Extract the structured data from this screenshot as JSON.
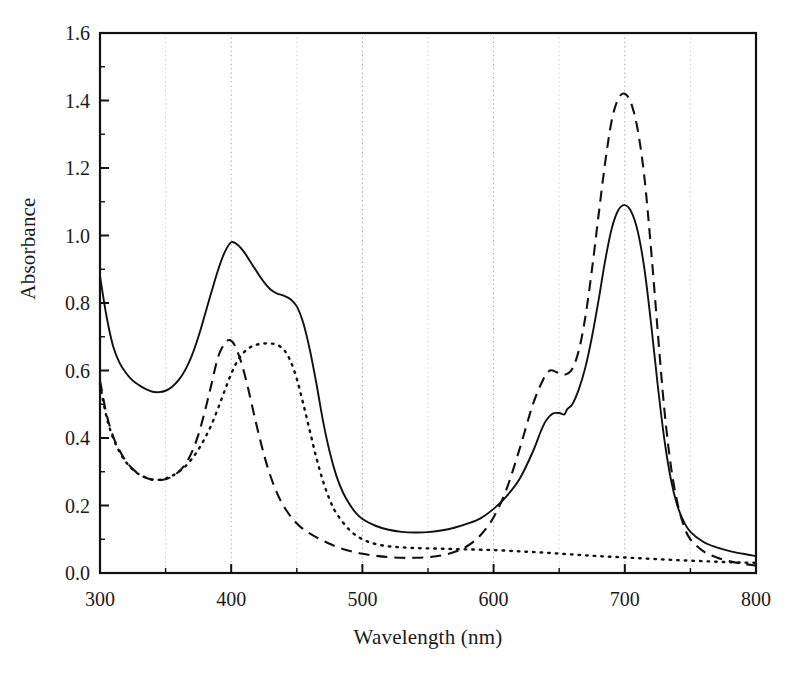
{
  "chart_data": {
    "type": "line",
    "title": "",
    "xlabel": "Wavelength (nm)",
    "ylabel": "Absorbance",
    "xlim": [
      300,
      800
    ],
    "ylim": [
      0.0,
      1.6
    ],
    "xticks": [
      300,
      400,
      500,
      600,
      700,
      800
    ],
    "xtick_labels": [
      "300",
      "400",
      "500",
      "600",
      "700",
      "800"
    ],
    "xminor_step": 50,
    "yticks": [
      0.0,
      0.2,
      0.4,
      0.6,
      0.8,
      1.0,
      1.2,
      1.4,
      1.6
    ],
    "ytick_labels": [
      "0.0",
      "0.2",
      "0.4",
      "0.6",
      "0.8",
      "1.0",
      "1.2",
      "1.4",
      "1.6"
    ],
    "yminor_step": 0.1,
    "grid": "vertical-dotted-every-50nm",
    "legend": "none",
    "frame": "full-box",
    "series": [
      {
        "name": "solid",
        "style": "solid",
        "color": "#111111",
        "peaks_nm": [
          400,
          430,
          645,
          700
        ],
        "peak_values": [
          0.98,
          0.83,
          0.475,
          1.09
        ],
        "x": [
          300,
          305,
          310,
          315,
          320,
          325,
          330,
          335,
          340,
          345,
          350,
          355,
          360,
          365,
          370,
          375,
          380,
          385,
          390,
          395,
          400,
          405,
          410,
          415,
          420,
          425,
          430,
          435,
          440,
          445,
          450,
          455,
          460,
          465,
          470,
          475,
          480,
          485,
          490,
          495,
          500,
          510,
          520,
          530,
          540,
          550,
          560,
          570,
          580,
          590,
          600,
          610,
          620,
          630,
          636,
          640,
          645,
          650,
          654,
          656,
          660,
          665,
          670,
          675,
          680,
          685,
          690,
          695,
          700,
          705,
          710,
          715,
          720,
          725,
          730,
          735,
          740,
          745,
          750,
          760,
          770,
          780,
          790,
          800
        ],
        "y": [
          0.88,
          0.76,
          0.672,
          0.622,
          0.592,
          0.57,
          0.556,
          0.545,
          0.537,
          0.536,
          0.54,
          0.552,
          0.572,
          0.602,
          0.644,
          0.7,
          0.766,
          0.833,
          0.898,
          0.95,
          0.98,
          0.972,
          0.95,
          0.92,
          0.89,
          0.862,
          0.84,
          0.828,
          0.822,
          0.812,
          0.79,
          0.74,
          0.66,
          0.56,
          0.45,
          0.36,
          0.29,
          0.24,
          0.205,
          0.178,
          0.16,
          0.14,
          0.128,
          0.122,
          0.12,
          0.121,
          0.126,
          0.134,
          0.146,
          0.162,
          0.19,
          0.228,
          0.28,
          0.36,
          0.42,
          0.452,
          0.472,
          0.474,
          0.47,
          0.485,
          0.5,
          0.545,
          0.61,
          0.7,
          0.808,
          0.925,
          1.02,
          1.075,
          1.09,
          1.07,
          1.01,
          0.9,
          0.74,
          0.56,
          0.4,
          0.28,
          0.2,
          0.152,
          0.122,
          0.092,
          0.076,
          0.065,
          0.057,
          0.05
        ]
      },
      {
        "name": "dashed",
        "style": "dashed",
        "color": "#111111",
        "peaks_nm": [
          399,
          643,
          700
        ],
        "peak_values": [
          0.69,
          0.6,
          1.42
        ],
        "x": [
          300,
          305,
          310,
          315,
          320,
          325,
          330,
          335,
          340,
          345,
          350,
          355,
          360,
          365,
          370,
          375,
          380,
          385,
          390,
          395,
          399,
          403,
          408,
          413,
          418,
          423,
          428,
          433,
          438,
          443,
          448,
          453,
          458,
          463,
          470,
          480,
          490,
          500,
          510,
          520,
          530,
          540,
          550,
          560,
          570,
          580,
          590,
          600,
          610,
          620,
          630,
          638,
          643,
          648,
          652,
          656,
          660,
          665,
          670,
          675,
          680,
          685,
          690,
          695,
          700,
          705,
          710,
          715,
          720,
          725,
          730,
          735,
          740,
          745,
          750,
          760,
          770,
          780,
          790,
          800
        ],
        "y": [
          0.57,
          0.47,
          0.405,
          0.362,
          0.33,
          0.308,
          0.292,
          0.282,
          0.276,
          0.275,
          0.278,
          0.286,
          0.3,
          0.322,
          0.358,
          0.41,
          0.48,
          0.56,
          0.64,
          0.68,
          0.69,
          0.672,
          0.62,
          0.545,
          0.46,
          0.38,
          0.31,
          0.255,
          0.212,
          0.18,
          0.155,
          0.136,
          0.122,
          0.11,
          0.096,
          0.078,
          0.066,
          0.057,
          0.051,
          0.047,
          0.045,
          0.045,
          0.047,
          0.052,
          0.062,
          0.08,
          0.112,
          0.165,
          0.25,
          0.37,
          0.5,
          0.575,
          0.6,
          0.595,
          0.588,
          0.59,
          0.605,
          0.66,
          0.76,
          0.9,
          1.06,
          1.215,
          1.34,
          1.405,
          1.42,
          1.39,
          1.31,
          1.17,
          0.96,
          0.72,
          0.49,
          0.32,
          0.21,
          0.14,
          0.1,
          0.064,
          0.046,
          0.035,
          0.027,
          0.022
        ]
      },
      {
        "name": "dotted",
        "style": "dotted",
        "color": "#111111",
        "peaks_nm": [
          430
        ],
        "peak_values": [
          0.68
        ],
        "x": [
          300,
          305,
          310,
          315,
          320,
          325,
          330,
          335,
          340,
          345,
          350,
          355,
          360,
          365,
          370,
          375,
          380,
          385,
          390,
          395,
          400,
          405,
          410,
          415,
          420,
          425,
          430,
          435,
          440,
          445,
          450,
          455,
          460,
          465,
          470,
          475,
          480,
          490,
          500,
          510,
          520,
          530,
          540,
          550,
          560,
          570,
          580,
          590,
          600,
          620,
          640,
          660,
          680,
          700,
          720,
          740,
          760,
          780,
          800
        ],
        "y": [
          0.56,
          0.462,
          0.4,
          0.358,
          0.328,
          0.306,
          0.292,
          0.283,
          0.277,
          0.276,
          0.28,
          0.288,
          0.3,
          0.316,
          0.338,
          0.366,
          0.4,
          0.44,
          0.488,
          0.54,
          0.59,
          0.63,
          0.655,
          0.67,
          0.677,
          0.68,
          0.68,
          0.676,
          0.662,
          0.63,
          0.575,
          0.5,
          0.42,
          0.34,
          0.272,
          0.218,
          0.178,
          0.128,
          0.1,
          0.086,
          0.079,
          0.076,
          0.074,
          0.073,
          0.072,
          0.071,
          0.07,
          0.069,
          0.068,
          0.064,
          0.06,
          0.055,
          0.05,
          0.046,
          0.042,
          0.038,
          0.035,
          0.032,
          0.03
        ]
      }
    ]
  }
}
